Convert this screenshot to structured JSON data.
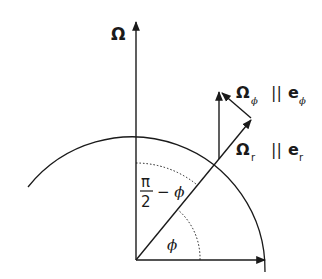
{
  "diagram": {
    "labels": {
      "omega_axis": "Ω",
      "omega_phi": "Ω",
      "omega_phi_sub": "ϕ",
      "parallel_1": "||",
      "e_phi": "e",
      "e_phi_sub": "ϕ",
      "omega_r": "Ω",
      "omega_r_sub": "r",
      "parallel_2": "||",
      "e_r": "e",
      "e_r_sub": "r",
      "frac_num": "π",
      "frac_den": "2",
      "minus_phi": "− ϕ",
      "phi_angle": "ϕ"
    },
    "colors": {
      "stroke": "#1a1a1a",
      "background": "#ffffff"
    }
  }
}
